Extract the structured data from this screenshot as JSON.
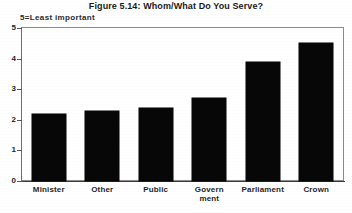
{
  "chart_data": {
    "type": "bar",
    "title": "Figure 5.14: Whom/What Do You Serve?",
    "subtitle": "5=Least important",
    "categories": [
      "Minister",
      "Other",
      "Public",
      "Government",
      "Parliament",
      "Crown"
    ],
    "category_lines": [
      [
        "Minister"
      ],
      [
        "Other"
      ],
      [
        "Public"
      ],
      [
        "Govern",
        "ment"
      ],
      [
        "Parliament"
      ],
      [
        "Crown"
      ]
    ],
    "values": [
      2.2,
      2.3,
      2.4,
      2.7,
      3.9,
      4.5
    ],
    "xlabel": "",
    "ylabel": "",
    "ylim": [
      0,
      5
    ],
    "yticks": [
      0,
      1,
      2,
      3,
      4,
      5
    ],
    "ytick_labels": [
      "0",
      "1",
      "2",
      "3",
      "4",
      "5"
    ],
    "grid": false,
    "legend": "none",
    "series_color": "#070707",
    "frame_color": "#8a8a8a",
    "background_color": "#ffffff"
  }
}
